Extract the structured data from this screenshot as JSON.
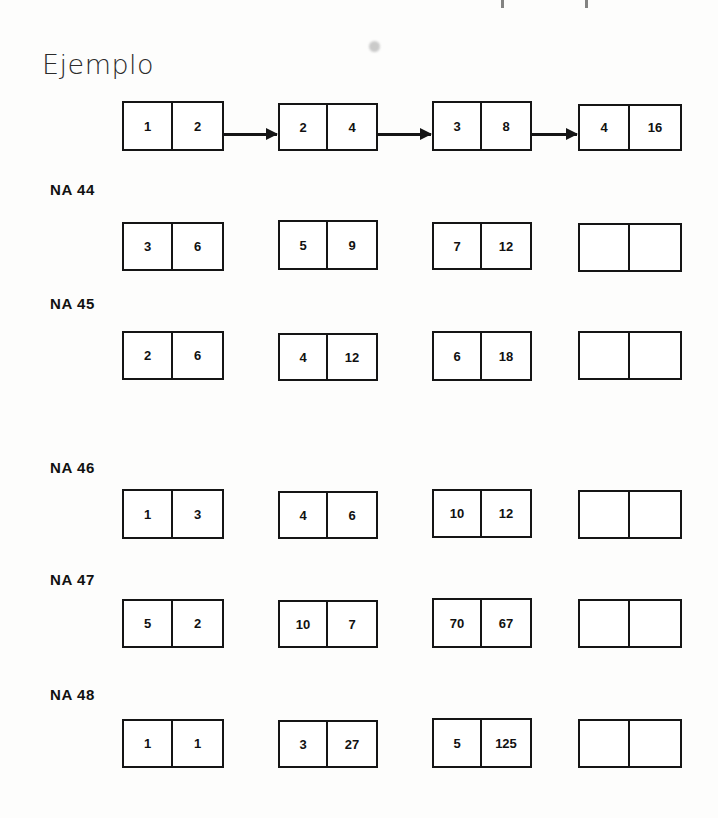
{
  "document": {
    "example_heading": "Ejemplo",
    "artifacts": {
      "smudge": "ink-smudge",
      "top_descenders": "cut-off-text-above"
    }
  },
  "example_row": {
    "label": "Ejemplo",
    "rule": "multiply by 2 / powers of two",
    "arrows": 3,
    "pairs": [
      {
        "left": "1",
        "right": "2"
      },
      {
        "left": "2",
        "right": "4"
      },
      {
        "left": "3",
        "right": "8"
      },
      {
        "left": "4",
        "right": "16"
      }
    ]
  },
  "exercises": [
    {
      "label": "NA 44",
      "rule": "add 3",
      "pairs": [
        {
          "left": "3",
          "right": "6"
        },
        {
          "left": "5",
          "right": "9"
        },
        {
          "left": "7",
          "right": "12"
        },
        {
          "left": "",
          "right": ""
        }
      ]
    },
    {
      "label": "NA 45",
      "rule": "multiply by 3",
      "pairs": [
        {
          "left": "2",
          "right": "6"
        },
        {
          "left": "4",
          "right": "12"
        },
        {
          "left": "6",
          "right": "18"
        },
        {
          "left": "",
          "right": ""
        }
      ]
    },
    {
      "label": "NA 46",
      "rule": "add 2",
      "pairs": [
        {
          "left": "1",
          "right": "3"
        },
        {
          "left": "4",
          "right": "6"
        },
        {
          "left": "10",
          "right": "12"
        },
        {
          "left": "",
          "right": ""
        }
      ]
    },
    {
      "label": "NA 47",
      "rule": "subtract 3",
      "pairs": [
        {
          "left": "5",
          "right": "2"
        },
        {
          "left": "10",
          "right": "7"
        },
        {
          "left": "70",
          "right": "67"
        },
        {
          "left": "",
          "right": ""
        }
      ]
    },
    {
      "label": "NA 48",
      "rule": "cube",
      "pairs": [
        {
          "left": "1",
          "right": "1"
        },
        {
          "left": "3",
          "right": "27"
        },
        {
          "left": "5",
          "right": "125"
        },
        {
          "left": "",
          "right": ""
        }
      ]
    }
  ],
  "colors": {
    "ink": "#151515",
    "paper": "#fdfdfc",
    "heading": "#2b2b2b"
  }
}
